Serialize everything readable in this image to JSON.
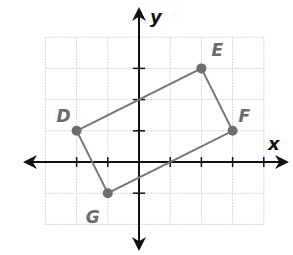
{
  "diagram": {
    "type": "coordinate-plane",
    "axes": {
      "x_label": "x",
      "y_label": "y"
    },
    "grid": {
      "x_min": -3,
      "x_max": 4,
      "y_min": -2,
      "y_max": 4,
      "step": 1
    },
    "points": [
      {
        "label": "D",
        "x": -2,
        "y": 1
      },
      {
        "label": "E",
        "x": 2,
        "y": 3
      },
      {
        "label": "F",
        "x": 3,
        "y": 1
      },
      {
        "label": "G",
        "x": -1,
        "y": -1
      }
    ],
    "polygon": [
      "D",
      "E",
      "F",
      "G"
    ],
    "colors": {
      "shape": "#777777",
      "axis": "#111111",
      "grid": "#d4d4d4"
    }
  }
}
